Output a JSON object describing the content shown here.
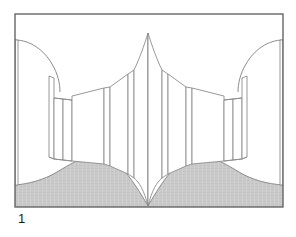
{
  "figure": {
    "caption": "1",
    "domain_note": "line-art architectural perspective drawing",
    "colors": {
      "background": "#ffffff",
      "frame_border": "#5a5a5a",
      "panel_outline": "#8c8c8c",
      "panel_fill": "#ffffff",
      "floor_fill": "#cacaca",
      "floor_outline": "#8c8c8c",
      "caption_text": "#1a1a1a"
    },
    "frame": {
      "x": 15,
      "y": 14,
      "width": 268,
      "height": 193,
      "stroke_width": 1.2
    },
    "drawing_type": "perspective-line-art",
    "symmetry": "bilateral-mirror-about-vertical-center",
    "center_x": 149,
    "elements": {
      "left_wall_curve": "concave curve sweeping from upper-left frame edge down to the right",
      "right_wall_curve": "mirrored concave curve sweeping from upper-right frame edge down to the left",
      "center_apex": "two tall panels meeting at a pointed apex near top center and a point at floor center",
      "panel_count_per_side": 7,
      "floor": "shaded gray region with curved upper boundary meeting at bottom center point"
    }
  }
}
